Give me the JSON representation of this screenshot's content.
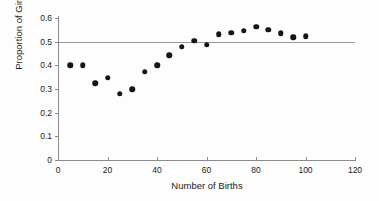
{
  "chart_data": {
    "type": "scatter",
    "title": "",
    "xlabel": "Number of Births",
    "ylabel": "Proportion of Girls",
    "xlim": [
      0,
      120
    ],
    "ylim": [
      0,
      0.6
    ],
    "grid": false,
    "legend": null,
    "x_ticks": [
      "0",
      "20",
      "40",
      "60",
      "80",
      "100",
      "120"
    ],
    "x_tick_values": [
      0,
      20,
      40,
      60,
      80,
      100,
      120
    ],
    "y_ticks": [
      "0",
      "0.1",
      "0.2",
      "0.3",
      "0.4",
      "0.5",
      "0.6"
    ],
    "y_tick_values": [
      0,
      0.1,
      0.2,
      0.3,
      0.4,
      0.5,
      0.6
    ],
    "reference_lines": [
      {
        "axis": "y",
        "value": 0.5,
        "color": "#9a9a9a"
      }
    ],
    "marker_color": "#151515",
    "x": [
      5,
      10,
      15,
      20,
      25,
      30,
      35,
      40,
      45,
      50,
      55,
      60,
      65,
      70,
      75,
      80,
      85,
      90,
      95,
      100
    ],
    "y": [
      0.4,
      0.4,
      0.325,
      0.348,
      0.28,
      0.3,
      0.372,
      0.4,
      0.443,
      0.478,
      0.503,
      0.488,
      0.532,
      0.538,
      0.547,
      0.563,
      0.551,
      0.536,
      0.518,
      0.523
    ],
    "points": [
      {
        "x": 5,
        "y": 0.4
      },
      {
        "x": 10,
        "y": 0.4
      },
      {
        "x": 15,
        "y": 0.325
      },
      {
        "x": 20,
        "y": 0.348
      },
      {
        "x": 25,
        "y": 0.28
      },
      {
        "x": 30,
        "y": 0.3
      },
      {
        "x": 35,
        "y": 0.372
      },
      {
        "x": 40,
        "y": 0.4
      },
      {
        "x": 45,
        "y": 0.443
      },
      {
        "x": 50,
        "y": 0.478
      },
      {
        "x": 55,
        "y": 0.503
      },
      {
        "x": 60,
        "y": 0.488
      },
      {
        "x": 65,
        "y": 0.532
      },
      {
        "x": 70,
        "y": 0.538
      },
      {
        "x": 75,
        "y": 0.547
      },
      {
        "x": 80,
        "y": 0.563
      },
      {
        "x": 85,
        "y": 0.551
      },
      {
        "x": 90,
        "y": 0.536
      },
      {
        "x": 95,
        "y": 0.518
      },
      {
        "x": 100,
        "y": 0.523
      }
    ]
  }
}
